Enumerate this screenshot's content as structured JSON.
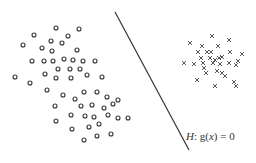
{
  "diagram": {
    "title": "",
    "hyperplane": {
      "label_var": "H",
      "label_sep": ": ",
      "label_func": "g(",
      "label_arg": "x",
      "label_rest": ") = 0",
      "line": {
        "x1": 115,
        "y1": 12,
        "x2": 189,
        "y2": 150
      },
      "color": "#333333"
    },
    "class_circles": {
      "marker": "circle",
      "color": "#333333",
      "points": [
        [
          56,
          28
        ],
        [
          79,
          29
        ],
        [
          34,
          35
        ],
        [
          68,
          36
        ],
        [
          23,
          45
        ],
        [
          51,
          41
        ],
        [
          42,
          48
        ],
        [
          62,
          43
        ],
        [
          52,
          51
        ],
        [
          77,
          50
        ],
        [
          32,
          61
        ],
        [
          44,
          61
        ],
        [
          53,
          61
        ],
        [
          64,
          59
        ],
        [
          73,
          60
        ],
        [
          83,
          61
        ],
        [
          95,
          61
        ],
        [
          58,
          69
        ],
        [
          70,
          69
        ],
        [
          80,
          69
        ],
        [
          15,
          77
        ],
        [
          45,
          74
        ],
        [
          56,
          78
        ],
        [
          71,
          78
        ],
        [
          87,
          75
        ],
        [
          102,
          77
        ],
        [
          30,
          83
        ],
        [
          47,
          90
        ],
        [
          63,
          95
        ],
        [
          84,
          92
        ],
        [
          97,
          92
        ],
        [
          107,
          97
        ],
        [
          75,
          99
        ],
        [
          55,
          106
        ],
        [
          81,
          106
        ],
        [
          92,
          105
        ],
        [
          104,
          108
        ],
        [
          113,
          104
        ],
        [
          118,
          100
        ],
        [
          71,
          115
        ],
        [
          56,
          121
        ],
        [
          85,
          116
        ],
        [
          94,
          117
        ],
        [
          108,
          115
        ],
        [
          118,
          118
        ],
        [
          128,
          118
        ],
        [
          72,
          129
        ],
        [
          89,
          127
        ],
        [
          99,
          124
        ],
        [
          84,
          140
        ],
        [
          97,
          136
        ],
        [
          111,
          134
        ]
      ]
    },
    "class_crosses": {
      "marker": "cross",
      "color": "#444444",
      "points": [
        [
          212,
          36
        ],
        [
          190,
          43
        ],
        [
          202,
          46
        ],
        [
          229,
          40
        ],
        [
          218,
          46
        ],
        [
          198,
          52
        ],
        [
          207,
          52
        ],
        [
          211,
          52
        ],
        [
          230,
          52
        ],
        [
          242,
          54
        ],
        [
          201,
          58
        ],
        [
          210,
          58
        ],
        [
          215,
          60
        ],
        [
          219,
          58
        ],
        [
          222,
          57
        ],
        [
          238,
          61
        ],
        [
          184,
          63
        ],
        [
          194,
          64
        ],
        [
          203,
          63
        ],
        [
          213,
          63
        ],
        [
          220,
          64
        ],
        [
          229,
          63
        ],
        [
          236,
          65
        ],
        [
          204,
          68
        ],
        [
          217,
          71
        ],
        [
          222,
          73
        ],
        [
          206,
          73
        ],
        [
          225,
          76
        ],
        [
          197,
          80
        ],
        [
          234,
          82
        ],
        [
          215,
          86
        ],
        [
          236,
          86
        ]
      ]
    }
  }
}
